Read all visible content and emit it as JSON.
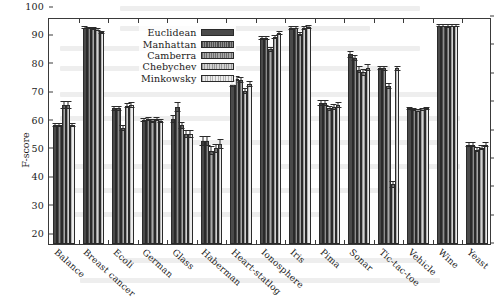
{
  "chart_data": {
    "type": "bar",
    "title": "",
    "xlabel": "",
    "ylabel": "F-score",
    "ylim": [
      20,
      100
    ],
    "yticks": [
      20,
      30,
      40,
      50,
      60,
      70,
      80,
      90,
      100
    ],
    "grid": false,
    "legend_position": "top-center-left",
    "categories": [
      "Balance",
      "Breast cancer",
      "Ecoli",
      "German",
      "Glass",
      "Haberman",
      "Heart-statlog",
      "Ionosphere",
      "Iris",
      "Pima",
      "Sonar",
      "Tic-tac-toe",
      "Vehicle",
      "Wine",
      "Yeast"
    ],
    "series": [
      {
        "name": "Euclidean",
        "values": [
          62.0,
          96.3,
          67.8,
          63.8,
          63.9,
          56.2,
          76.3,
          92.6,
          96.2,
          69.6,
          86.8,
          82.0,
          67.8,
          97.0,
          55.0
        ],
        "errors": [
          0.8,
          0.4,
          0.9,
          0.7,
          1.4,
          1.8,
          1.0,
          0.7,
          0.6,
          1.1,
          1.2,
          0.8,
          0.6,
          0.5,
          0.9
        ]
      },
      {
        "name": "Manhattan",
        "values": [
          62.0,
          96.2,
          67.8,
          63.9,
          68.2,
          56.2,
          78.3,
          92.6,
          96.3,
          69.6,
          85.5,
          82.0,
          67.5,
          97.0,
          55.0
        ],
        "errors": [
          0.8,
          0.4,
          0.9,
          0.7,
          1.7,
          1.8,
          0.9,
          0.7,
          0.6,
          1.1,
          1.0,
          0.9,
          0.6,
          0.5,
          0.9
        ]
      },
      {
        "name": "Camberra",
        "values": [
          69.0,
          96.0,
          60.9,
          63.2,
          61.8,
          52.8,
          77.8,
          88.6,
          94.0,
          67.8,
          81.5,
          75.8,
          67.0,
          96.8,
          53.3
        ],
        "errors": [
          1.5,
          0.5,
          1.0,
          0.7,
          1.3,
          1.6,
          0.9,
          0.8,
          0.7,
          1.0,
          1.4,
          1.0,
          0.6,
          0.6,
          0.8
        ]
      },
      {
        "name": "Chebychev",
        "values": [
          69.0,
          95.6,
          68.8,
          64.0,
          58.8,
          53.8,
          74.0,
          92.8,
          96.2,
          68.4,
          80.5,
          41.0,
          67.4,
          96.9,
          54.0
        ],
        "errors": [
          1.5,
          0.5,
          1.0,
          0.7,
          1.4,
          1.6,
          1.0,
          0.7,
          0.6,
          1.1,
          1.3,
          1.2,
          0.6,
          0.5,
          0.9
        ]
      },
      {
        "name": "Minkowsky",
        "values": [
          62.0,
          94.6,
          69.1,
          63.3,
          58.8,
          55.3,
          76.3,
          94.4,
          96.5,
          69.0,
          82.2,
          82.0,
          67.8,
          96.9,
          55.0
        ],
        "errors": [
          0.8,
          0.6,
          1.0,
          0.7,
          1.4,
          1.7,
          1.0,
          0.7,
          0.6,
          1.1,
          1.2,
          0.9,
          0.6,
          0.5,
          0.9
        ]
      }
    ]
  },
  "legend": {
    "entries": [
      {
        "label": "Euclidean"
      },
      {
        "label": "Manhattan"
      },
      {
        "label": "Camberra"
      },
      {
        "label": "Chebychev"
      },
      {
        "label": "Minkowsky"
      }
    ]
  }
}
